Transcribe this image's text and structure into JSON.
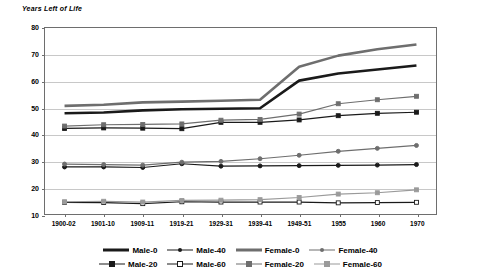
{
  "chart_data": {
    "type": "line",
    "title": "Years Left of Life",
    "xlabel": "",
    "ylabel": "Years Left of Life",
    "ylim": [
      10,
      80
    ],
    "ytick_step": 10,
    "yticks": [
      80,
      70,
      60,
      50,
      40,
      30,
      20,
      10
    ],
    "grid": true,
    "legend_position": "bottom",
    "categories": [
      "1900-02",
      "1901-10",
      "1909-11",
      "1919-21",
      "1929-31",
      "1939-41",
      "1949-51",
      "1955",
      "1960",
      "1970"
    ],
    "series": [
      {
        "name": "Male-0",
        "color": "#1a1a1a",
        "width": 2.6,
        "marker": "none",
        "values": [
          47.9,
          48.2,
          49.0,
          49.4,
          49.6,
          49.8,
          60.2,
          62.9,
          64.4,
          65.9
        ]
      },
      {
        "name": "Male-20",
        "color": "#1a1a1a",
        "width": 1.2,
        "marker": "square-filled",
        "values": [
          42.2,
          42.4,
          42.3,
          42.1,
          44.5,
          44.5,
          45.4,
          47.0,
          47.9,
          48.3
        ]
      },
      {
        "name": "Male-40",
        "color": "#1a1a1a",
        "width": 1.2,
        "marker": "circle-filled",
        "values": [
          27.7,
          27.7,
          27.5,
          28.9,
          28.0,
          28.1,
          28.2,
          28.3,
          28.4,
          28.6
        ]
      },
      {
        "name": "Male-60",
        "color": "#1a1a1a",
        "width": 1.2,
        "marker": "square-open",
        "values": [
          14.4,
          14.3,
          13.9,
          14.6,
          14.5,
          14.5,
          14.5,
          14.2,
          14.3,
          14.4
        ]
      },
      {
        "name": "Female-0",
        "color": "#6e6e6e",
        "width": 2.6,
        "marker": "none",
        "values": [
          50.7,
          51.1,
          52.0,
          52.3,
          52.6,
          53.0,
          65.4,
          69.6,
          72.0,
          73.8
        ]
      },
      {
        "name": "Female-20",
        "color": "#6e6e6e",
        "width": 1.2,
        "marker": "square-filled",
        "values": [
          43.1,
          43.6,
          43.7,
          43.9,
          45.3,
          45.6,
          47.6,
          51.5,
          53.0,
          54.3
        ]
      },
      {
        "name": "Female-40",
        "color": "#6e6e6e",
        "width": 1.2,
        "marker": "circle-filled",
        "values": [
          28.8,
          28.6,
          28.4,
          29.5,
          29.8,
          30.8,
          32.1,
          33.6,
          34.7,
          35.8
        ]
      },
      {
        "name": "Female-60",
        "color": "#9a9a9a",
        "width": 1.2,
        "marker": "square-filled",
        "values": [
          14.6,
          14.8,
          14.5,
          15.1,
          15.2,
          15.4,
          16.2,
          17.5,
          18.0,
          19.1
        ]
      }
    ]
  },
  "legend": {
    "row1": [
      "Male-0",
      "Male-40",
      "Female-0",
      "Female-40"
    ],
    "row2": [
      "Male-20",
      "Male-60",
      "Female-20",
      "Female-60"
    ]
  },
  "footer": {
    "note": ""
  }
}
